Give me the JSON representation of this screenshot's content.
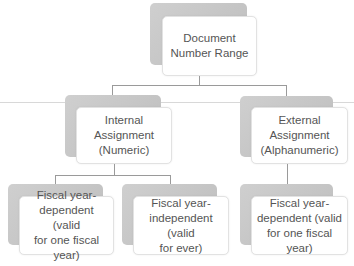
{
  "diagram": {
    "root": {
      "label": "Document Number Range"
    },
    "level1": [
      {
        "label": "Internal Assignment (Numeric)",
        "lines": [
          "Internal",
          "Assignment",
          "(Numeric)"
        ]
      },
      {
        "label": "External Assignment (Alphanumeric)",
        "lines": [
          "External",
          "Assignment",
          "(Alphanumeric)"
        ]
      }
    ],
    "level2": [
      {
        "parent": "Internal Assignment (Numeric)",
        "lines": [
          "Fiscal year-",
          "dependent (valid",
          "for one fiscal year)"
        ]
      },
      {
        "parent": "Internal Assignment (Numeric)",
        "lines": [
          "Fiscal year-",
          "independent (valid",
          "for ever)"
        ]
      },
      {
        "parent": "External Assignment (Alphanumeric)",
        "lines": [
          "Fiscal year-",
          "dependent (valid",
          "for one fiscal year)"
        ]
      }
    ],
    "root_lines": [
      "Document",
      "Number Range"
    ]
  },
  "colors": {
    "shadow": "#c4c4c4",
    "card": "#ffffff",
    "text": "#555555",
    "connector": "#9a9a9a"
  }
}
